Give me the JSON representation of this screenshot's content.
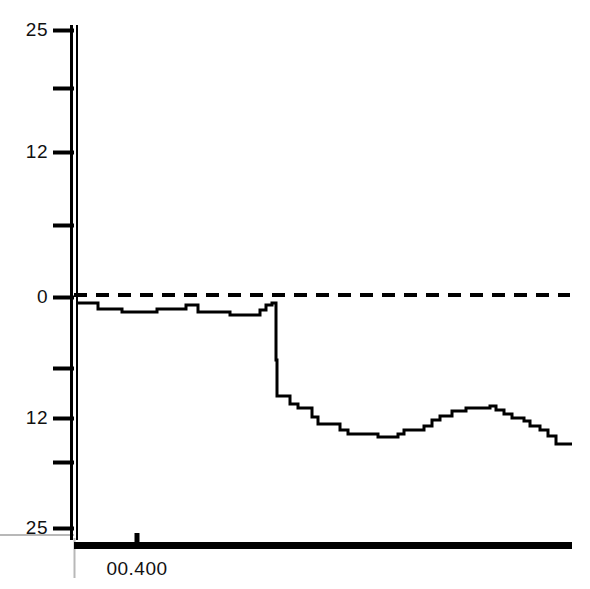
{
  "chart_data": {
    "type": "line",
    "title": "",
    "xlabel": "",
    "ylabel": "",
    "ylim": [
      -25,
      25
    ],
    "grid": false,
    "legend": null,
    "y_ticks": [
      {
        "label": "25",
        "value": 25,
        "px": 30,
        "labeled": true
      },
      {
        "label": "",
        "value": 18.75,
        "px": 88,
        "labeled": false
      },
      {
        "label": "12",
        "value": 12,
        "px": 152,
        "labeled": true
      },
      {
        "label": "",
        "value": 6,
        "px": 225,
        "labeled": false
      },
      {
        "label": "0",
        "value": 0,
        "px": 297,
        "labeled": true
      },
      {
        "label": "",
        "value": -6,
        "px": 368,
        "labeled": false
      },
      {
        "label": "12",
        "value": -12,
        "px": 418,
        "labeled": true
      },
      {
        "label": "",
        "value": -18,
        "px": 462,
        "labeled": false
      },
      {
        "label": "25",
        "value": -25,
        "px": 528,
        "labeled": true
      }
    ],
    "x_ticks": [
      {
        "label": "00.400",
        "px": 137
      }
    ],
    "reference_line": {
      "value": 0,
      "style": "dashed",
      "y_px": 295
    },
    "series": [
      {
        "name": "signal",
        "style": "step",
        "color": "#000000",
        "points": [
          [
            76,
            303
          ],
          [
            98,
            303
          ],
          [
            98,
            309
          ],
          [
            122,
            309
          ],
          [
            122,
            312
          ],
          [
            157,
            312
          ],
          [
            157,
            309
          ],
          [
            186,
            309
          ],
          [
            186,
            305
          ],
          [
            198,
            305
          ],
          [
            198,
            312
          ],
          [
            230,
            312
          ],
          [
            230,
            315
          ],
          [
            260,
            315
          ],
          [
            260,
            310
          ],
          [
            266,
            310
          ],
          [
            266,
            305
          ],
          [
            272,
            305
          ],
          [
            272,
            303
          ],
          [
            276,
            303
          ],
          [
            276,
            360
          ],
          [
            277,
            360
          ],
          [
            277,
            396
          ],
          [
            290,
            396
          ],
          [
            290,
            404
          ],
          [
            298,
            404
          ],
          [
            298,
            408
          ],
          [
            312,
            408
          ],
          [
            312,
            417
          ],
          [
            318,
            417
          ],
          [
            318,
            424
          ],
          [
            340,
            424
          ],
          [
            340,
            430
          ],
          [
            348,
            430
          ],
          [
            348,
            434
          ],
          [
            378,
            434
          ],
          [
            378,
            437
          ],
          [
            398,
            437
          ],
          [
            398,
            434
          ],
          [
            404,
            434
          ],
          [
            404,
            430
          ],
          [
            424,
            430
          ],
          [
            424,
            426
          ],
          [
            432,
            426
          ],
          [
            432,
            420
          ],
          [
            440,
            420
          ],
          [
            440,
            416
          ],
          [
            452,
            416
          ],
          [
            452,
            411
          ],
          [
            466,
            411
          ],
          [
            466,
            408
          ],
          [
            490,
            408
          ],
          [
            490,
            406
          ],
          [
            496,
            406
          ],
          [
            496,
            410
          ],
          [
            504,
            410
          ],
          [
            504,
            414
          ],
          [
            512,
            414
          ],
          [
            512,
            418
          ],
          [
            524,
            418
          ],
          [
            524,
            421
          ],
          [
            530,
            421
          ],
          [
            530,
            426
          ],
          [
            540,
            426
          ],
          [
            540,
            430
          ],
          [
            548,
            430
          ],
          [
            548,
            436
          ],
          [
            556,
            436
          ],
          [
            556,
            444
          ],
          [
            572,
            444
          ]
        ]
      }
    ]
  },
  "axes": {
    "y_axis": {
      "x_px": 74,
      "top_px": 25,
      "bottom_px": 538,
      "color": "#000000"
    },
    "x_axis": {
      "y_px": 545,
      "left_px": 74,
      "right_px": 572,
      "color": "#000000"
    },
    "guide_horizontal": {
      "y_px": 535,
      "left_px": 0,
      "right_px": 74,
      "color": "#b8b8b8"
    },
    "guide_vertical": {
      "x_px": 74,
      "top_px": 538,
      "bottom_px": 578,
      "color": "#b8b8b8"
    }
  }
}
